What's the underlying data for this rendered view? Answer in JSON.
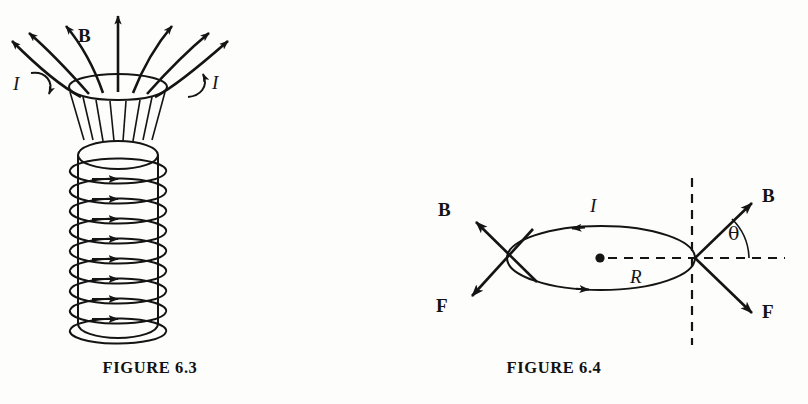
{
  "page": {
    "background_color": "#fdfdfc",
    "ink_color": "#141414",
    "width": 808,
    "height": 404
  },
  "figures": [
    {
      "id": "figure-6-3",
      "caption": "FIGURE 6.3",
      "subject": "solenoid-magnetic-field",
      "labels": {
        "field_label": "B",
        "current_label_left": "I",
        "current_label_right": "I"
      },
      "geometry": {
        "coil_turns": 9,
        "field_lines": 7,
        "flare_lines": 8
      }
    },
    {
      "id": "figure-6-4",
      "caption": "FIGURE 6.4",
      "subject": "current-loop-force-and-field",
      "labels": {
        "field_label_left": "B",
        "force_label_left": "F",
        "field_label_right": "B",
        "force_label_right": "F",
        "angle_label": "θ",
        "current_label": "I",
        "radius_label": "R"
      },
      "geometry": {
        "loop_shape": "ellipse",
        "dashed_axis_vertical": true,
        "dashed_axis_horizontal": true,
        "center_dot": true
      }
    }
  ]
}
